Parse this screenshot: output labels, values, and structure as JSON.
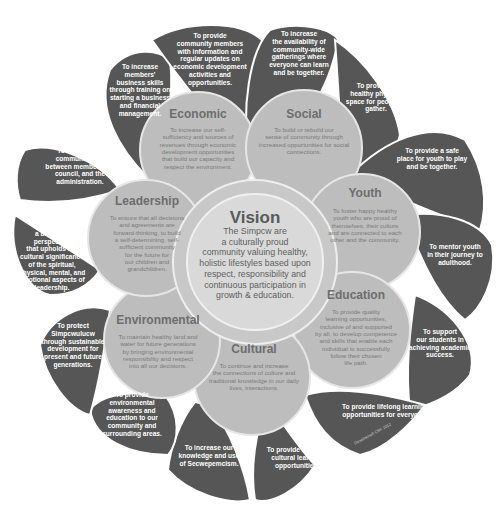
{
  "colors": {
    "petal": "#565656",
    "circle_outer": "#bdbdbd",
    "circle_stroke": "#e6e6e6",
    "vision_fill": "#d9d9d9",
    "vision_ring": "#c8c8c8",
    "background": "#ffffff"
  },
  "vision": {
    "title": "Vision",
    "text": "The Simpcw are\na culturally proud\ncommunity valuing healthy,\nholistic lifestyles based upon\nrespect, responsibility and\ncontinuous participation in\ngrowth & education."
  },
  "pillars": [
    {
      "title": "Economic",
      "text": "To increase our self-\nsufficiency and sources of\nrevenues through economic\ndevelopment opportunities\nthat build our capacity and\nrespect the environment."
    },
    {
      "title": "Social",
      "text": "To build or rebuild our\nsense of community through\nincreased opportunities for social\nconnections."
    },
    {
      "title": "Youth",
      "text": "To foster happy healthy\nyouth who are proud of\nthemselves, their culture\nand are connected to each\nother and the community."
    },
    {
      "title": "Education",
      "text": "To provide quality\nlearning opportunities,\ninclusive of and supported\nby all, to develop competence\nand skills that enable each\nindividual to successfully\nfollow their chosen\nlife path."
    },
    {
      "title": "Cultural",
      "text": "To continue and increase\nthe connections of culture and\ntraditional knowledge in our daily\nlives, interactions."
    },
    {
      "title": "Environmental",
      "text": "To maintain healthy land and\nwater for future generations\nby bringing environmental\nresponsibility and respect\ninto all our decisions."
    },
    {
      "title": "Leadership",
      "text": "To ensure that all decisions\nand agreements are\nforward-thinking, to build\na self-determining, self-\nsufficient community\nfor the future for\nour children and\ngrandchildren."
    }
  ],
  "petals": [
    {
      "id": "econ-business",
      "text": "To increase\nmembers'\nbusiness skills\nthrough training on\nstarting a business\nand financial\nmanagement."
    },
    {
      "id": "econ-info",
      "text": "To provide\ncommunity members\nwith information and\nregular updates on\neconomic development\nactivities and\nopportunities."
    },
    {
      "id": "social-gatherings",
      "text": "To increase\nthe availability of\ncommunity-wide\ngatherings where\neveryone can learn\nand be together."
    },
    {
      "id": "social-space",
      "text": "To provide a\nhealthy physical\nspace for people to\ngather."
    },
    {
      "id": "youth-safe-place",
      "text": "To provide a safe\nplace for youth to play\nand be together."
    },
    {
      "id": "youth-mentor",
      "text": "To mentor youth\nin their journey to\nadulthood."
    },
    {
      "id": "edu-support",
      "text": "To support\nour students in\nachieving academic\nsuccess."
    },
    {
      "id": "edu-lifelong",
      "text": "To provide lifelong learning\nopportunities for everyone."
    },
    {
      "id": "cult-lifelong",
      "text": "To provide life long\ncultural learning\nopportunities."
    },
    {
      "id": "cult-language",
      "text": "To increase our\nknowledge and use\nof Secwepemcism."
    },
    {
      "id": "env-awareness",
      "text": "To provide\nenvironmental\nawareness and\neducation to our\ncommunity and\nsurrounding areas."
    },
    {
      "id": "env-protect",
      "text": "To protect\nSimpcwulucw\nthrough sustainable\ndevelopment for\npresent and future\ngenerations."
    },
    {
      "id": "lead-balanced",
      "text": "To provide\na balanced\nperspective\nthat upholds the\ncultural significance\nof the spiritual,\nphysical, mental, and\nemotional aspects of\nleadership."
    },
    {
      "id": "lead-communication",
      "text": "To foster good\ncommunication\nbetween membership,\ncouncil, and the\nadministration."
    }
  ],
  "credit": "Gesellschaft CBK 2012"
}
